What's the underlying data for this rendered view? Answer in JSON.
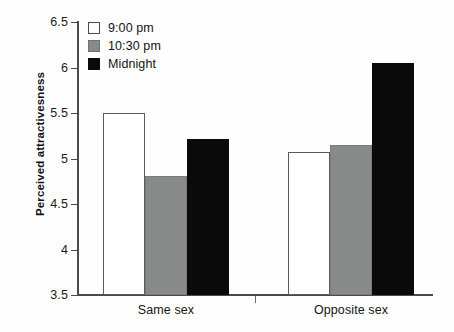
{
  "chart_data": {
    "type": "bar",
    "title": "",
    "xlabel": "",
    "ylabel": "Perceived attractivesness",
    "ylim": [
      3.5,
      6.5
    ],
    "ytick_step": 0.5,
    "yticks": [
      "6.5",
      "6",
      "5.5",
      "5",
      "4.5",
      "4",
      "3.5"
    ],
    "grid": false,
    "legend_position": "top-left",
    "categories": [
      "Same sex",
      "Opposite sex"
    ],
    "series": [
      {
        "name": "9:00 pm",
        "color": "#ffffff",
        "values": [
          5.5,
          5.07
        ]
      },
      {
        "name": "10:30 pm",
        "color": "#888a8a",
        "values": [
          4.81,
          5.15
        ]
      },
      {
        "name": "Midnight",
        "color": "#0a0a0a",
        "values": [
          5.21,
          6.05
        ]
      }
    ]
  },
  "axis": {
    "y_title": "Perceived attractivesness",
    "y_tick_labels": [
      "6.5",
      "6",
      "5.5",
      "5",
      "4.5",
      "4",
      "3.5"
    ],
    "x_tick_labels": [
      "Same sex",
      "Opposite sex"
    ]
  },
  "legend": {
    "items": [
      {
        "label": "9:00 pm",
        "swatch": "white-swatch"
      },
      {
        "label": "10:30 pm",
        "swatch": "gray-swatch"
      },
      {
        "label": "Midnight",
        "swatch": "black-swatch"
      }
    ]
  },
  "colors": {
    "white_series": "#ffffff",
    "gray_series": "#888a8a",
    "black_series": "#0a0a0a",
    "axis": "#4a4a4a",
    "text": "#131313",
    "background": "#fefefe"
  }
}
